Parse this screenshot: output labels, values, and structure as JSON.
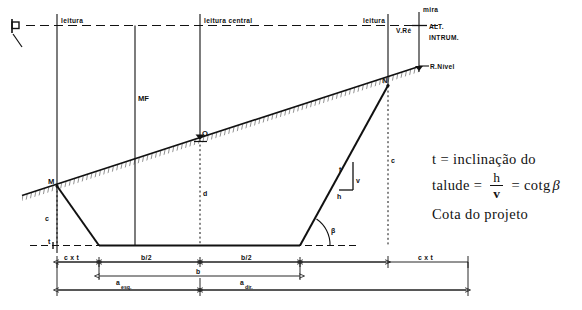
{
  "figure": {
    "labels": {
      "leitura_left": "leitura",
      "leitura_central": "leitura central",
      "leitura_right": "leitura",
      "mira": "mira",
      "v_re": "V.Ré",
      "alt_instrum_line1": "ALT.",
      "alt_instrum_line2": "INTRUM.",
      "r_nivel": "R.Nível",
      "mf": "MF",
      "point_o": "O",
      "point_m": "M",
      "point_n": "N",
      "d": "d",
      "c_left": "c",
      "c_right": "c",
      "t_left": "t",
      "t_slope": "t",
      "v": "v",
      "h": "h",
      "beta": "β"
    },
    "dimensions": {
      "cxt_left": "c x t",
      "b_half_left": "b/2",
      "b_half_right": "b/2",
      "cxt_right": "c x t",
      "b": "b",
      "a_esq_base": "a",
      "a_esq_sub": "esq.",
      "a_dir_base": "a",
      "a_dir_sub": "dir."
    },
    "formula": {
      "line1": "t = inclinação do",
      "line2_prefix": "talude",
      "line2_eq1": "=",
      "numerator": "h",
      "denominator": "v",
      "line2_eq2": "=",
      "line2_cotg": "cotg",
      "line2_beta": "β",
      "line3": "Cota do projeto"
    },
    "colors": {
      "ink": "#111111",
      "paper": "#ffffff",
      "hatch": "#2a2a2a"
    }
  }
}
